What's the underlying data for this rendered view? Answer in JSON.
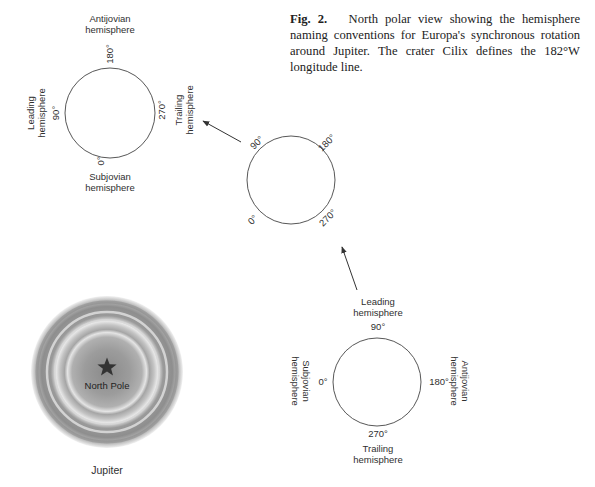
{
  "caption": {
    "label": "Fig. 2.",
    "text": "North polar view showing the hemisphere naming conventions for Europa's synchronous rotation around Jupiter. The crater Cilix defines the 182°W longitude line."
  },
  "jupiter": {
    "center_label": "North Pole",
    "name": "Jupiter"
  },
  "diagrams": {
    "top_left": {
      "top_deg": "180°",
      "left_deg": "90°",
      "right_deg": "270°",
      "bottom_deg": "0°",
      "top_hemi": [
        "Antijovian",
        "hemisphere"
      ],
      "left_hemi": [
        "Leading",
        "hemisphere"
      ],
      "right_hemi": [
        "Trailing",
        "hemisphere"
      ],
      "bottom_hemi": [
        "Subjovian",
        "hemisphere"
      ]
    },
    "middle": {
      "nw_deg": "90°",
      "ne_deg": "180°",
      "sw_deg": "0°",
      "se_deg": "270°"
    },
    "bottom_right": {
      "top_deg": "90°",
      "left_deg": "0°",
      "right_deg": "180°",
      "bottom_deg": "270°",
      "top_hemi": [
        "Leading",
        "hemisphere"
      ],
      "left_hemi": [
        "Subjovian",
        "hemisphere"
      ],
      "right_hemi": [
        "Antijovian",
        "hemisphere"
      ],
      "bottom_hemi": [
        "Trailing",
        "hemisphere"
      ]
    }
  }
}
